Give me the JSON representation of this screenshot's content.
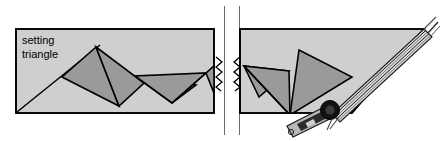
{
  "figure": {
    "title": "setting triangle",
    "label_lines": [
      "setting",
      "triangle"
    ],
    "break_symbol": "double-zigzag-break"
  },
  "colors": {
    "background": "#ffffff",
    "board_fill": "#cfcfcf",
    "triangle_fill": "#9a9a9a",
    "outline": "#000000",
    "straightedge_dark": "#1a1a1a",
    "straightedge_light": "#d8d8d8",
    "tool_body": "#b8b8b8",
    "tool_dark": "#2b2b2b",
    "pivot": "#111111"
  },
  "geometry": {
    "board": {
      "comment": "main light gray board polygon, left rectangle plus right wedge",
      "left_points": "16,29 214,29 214,113 16,113",
      "right_points": "240,29 424,29 352,113 240,113"
    },
    "triangles_left": [
      {
        "name": "triangle-1",
        "points": "62,77 96,47 119,106"
      },
      {
        "name": "triangle-2",
        "points": "96,47 144,83 119,106"
      },
      {
        "name": "triangle-3",
        "points": "135,76 172,103 196,85"
      },
      {
        "name": "triangle-4",
        "points": "135,76 172,103 206,73"
      },
      {
        "name": "triangle-5",
        "points": "206,73 214,66 214,96"
      }
    ],
    "triangles_right": [
      {
        "name": "triangle-6",
        "points": "246,66 259,96 288,72"
      },
      {
        "name": "triangle-7",
        "points": "246,66 288,72 290,114"
      },
      {
        "name": "triangle-8",
        "points": "290,114 299,50 349,75"
      }
    ],
    "straightedge": {
      "comment": "striped diagonal band along the lower-right hypotenuse",
      "from": "424,29",
      "to": "334,113",
      "stripe_count": 6
    },
    "bevel_tool": {
      "pivot_center": "330,110",
      "pivot_radius": 9,
      "handle_from": "330,110",
      "handle_to": "288,133",
      "pointer_angle_marks": 2
    }
  },
  "annotations": {
    "break_left_x": 214,
    "break_right_x": 240,
    "break_zigzag_peaks": 4
  }
}
